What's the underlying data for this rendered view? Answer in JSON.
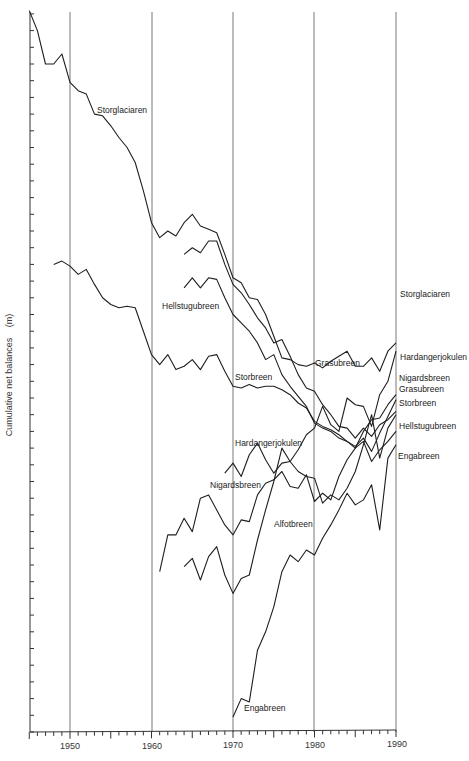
{
  "chart_data": {
    "type": "line",
    "title": "",
    "xlabel": "",
    "ylabel": "Cumulative net balances (m)",
    "xlim": [
      1945,
      1990
    ],
    "x_ticks": [
      1950,
      1960,
      1970,
      1980,
      1990
    ],
    "x_tick_labels": [
      "1950",
      "1960",
      "1970",
      "1980",
      "1990"
    ],
    "y_ticks_labeled": false,
    "y_units_note": "values in tick units above x-axis (no numeric y labels shown)",
    "grid": "vertical lines at decades",
    "legend": "inline labels",
    "series": [
      {
        "name": "Storglaciaren",
        "x": [
          1945,
          1946,
          1947,
          1948,
          1949,
          1950,
          1951,
          1952,
          1953,
          1954,
          1955,
          1956,
          1957,
          1958,
          1959,
          1960,
          1961,
          1962,
          1963,
          1964,
          1965,
          1966,
          1967,
          1968,
          1969,
          1970,
          1971,
          1972,
          1973,
          1974,
          1975,
          1976,
          1977,
          1978,
          1979,
          1980,
          1981,
          1982,
          1983,
          1984,
          1985,
          1986,
          1987,
          1988,
          1989,
          1990
        ],
        "values": [
          43.2,
          42.0,
          40.0,
          40.0,
          40.6,
          38.9,
          38.4,
          38.2,
          37.0,
          36.9,
          36.3,
          35.6,
          35.0,
          34.1,
          32.4,
          30.5,
          29.6,
          30.0,
          29.7,
          30.5,
          31.0,
          30.3,
          30.1,
          29.9,
          28.6,
          27.2,
          26.9,
          26.0,
          25.9,
          25.0,
          23.7,
          22.4,
          22.3,
          22.0,
          21.9,
          22.1,
          21.8,
          22.2,
          22.5,
          22.8,
          21.9,
          21.9,
          22.4,
          21.6,
          22.8,
          23.3
        ]
      },
      {
        "name": "Grasubreen",
        "x": [
          1964,
          1965,
          1966,
          1967,
          1968,
          1969,
          1970,
          1971,
          1972,
          1973,
          1974,
          1975,
          1976,
          1977,
          1978,
          1979,
          1980,
          1981,
          1982,
          1983,
          1984,
          1985,
          1986,
          1987,
          1988,
          1989,
          1990
        ],
        "values": [
          28.6,
          29.0,
          28.7,
          29.4,
          29.4,
          28.0,
          26.8,
          26.3,
          25.6,
          24.8,
          24.2,
          23.3,
          23.5,
          22.5,
          21.4,
          20.6,
          20.4,
          19.6,
          19.0,
          18.3,
          18.2,
          17.6,
          18.2,
          17.7,
          18.4,
          18.7,
          19.2
        ]
      },
      {
        "name": "Hellstugubreen",
        "x": [
          1964,
          1965,
          1966,
          1967,
          1968,
          1969,
          1970,
          1971,
          1972,
          1973,
          1974,
          1975,
          1976,
          1977,
          1978,
          1979,
          1980,
          1981,
          1982,
          1983,
          1984,
          1985,
          1986,
          1987,
          1988,
          1989,
          1990
        ],
        "values": [
          26.6,
          27.2,
          26.6,
          27.2,
          27.1,
          26.0,
          25.0,
          24.5,
          24.0,
          23.3,
          22.3,
          22.6,
          21.4,
          20.7,
          20.1,
          19.5,
          18.5,
          18.2,
          18.0,
          17.6,
          17.4,
          17.0,
          17.4,
          16.2,
          16.9,
          17.4,
          18.0
        ]
      },
      {
        "name": "Storbreen",
        "x": [
          1948,
          1949,
          1950,
          1951,
          1952,
          1953,
          1954,
          1955,
          1956,
          1957,
          1958,
          1959,
          1960,
          1961,
          1962,
          1963,
          1964,
          1965,
          1966,
          1967,
          1968,
          1969,
          1970,
          1971,
          1972,
          1973,
          1974,
          1975,
          1976,
          1977,
          1978,
          1979,
          1980,
          1981,
          1982,
          1983,
          1984,
          1985,
          1986,
          1987,
          1988,
          1989,
          1990
        ],
        "values": [
          28.0,
          28.2,
          27.9,
          27.4,
          27.7,
          26.8,
          26.0,
          25.6,
          25.4,
          25.5,
          25.4,
          24.0,
          22.6,
          22.0,
          22.6,
          21.7,
          21.9,
          22.3,
          21.7,
          22.5,
          22.6,
          21.6,
          20.7,
          20.6,
          20.8,
          20.6,
          20.7,
          20.7,
          20.5,
          20.2,
          19.7,
          19.4,
          18.6,
          18.3,
          18.1,
          17.8,
          17.4,
          17.1,
          17.6,
          16.8,
          17.9,
          18.9,
          19.9
        ]
      },
      {
        "name": "Hardangerjokulen",
        "x": [
          1969,
          1970,
          1971,
          1972,
          1973,
          1974,
          1975,
          1976,
          1977,
          1978,
          1979,
          1980,
          1981,
          1982,
          1983,
          1984,
          1985,
          1986,
          1987,
          1988,
          1989,
          1990
        ],
        "values": [
          15.5,
          16.1,
          15.3,
          16.6,
          17.3,
          16.3,
          15.5,
          16.1,
          16.2,
          16.9,
          17.8,
          18.2,
          19.5,
          18.4,
          18.0,
          20.0,
          19.6,
          19.5,
          18.3,
          20.2,
          21.0,
          22.8
        ]
      },
      {
        "name": "Nigardsbreen",
        "x": [
          1961,
          1962,
          1963,
          1964,
          1965,
          1966,
          1967,
          1968,
          1969,
          1970,
          1971,
          1972,
          1973,
          1974,
          1975,
          1976,
          1977,
          1978,
          1979,
          1980,
          1981,
          1982,
          1983,
          1984,
          1985,
          1986,
          1987,
          1988,
          1989,
          1990
        ],
        "values": [
          9.6,
          11.8,
          11.8,
          12.8,
          12.0,
          14.0,
          14.2,
          13.3,
          12.4,
          11.8,
          12.7,
          12.6,
          14.2,
          14.9,
          15.1,
          15.6,
          14.7,
          14.6,
          15.4,
          13.8,
          14.3,
          13.9,
          15.3,
          16.3,
          17.0,
          18.0,
          18.7,
          18.8,
          19.6,
          20.2
        ]
      },
      {
        "name": "Alfotbreen",
        "x": [
          1964,
          1965,
          1966,
          1967,
          1968,
          1969,
          1970,
          1971,
          1972,
          1973,
          1974,
          1975,
          1976,
          1977,
          1978,
          1979,
          1980,
          1981,
          1982,
          1983,
          1984,
          1985,
          1986,
          1987,
          1988,
          1989,
          1990
        ],
        "values": [
          9.9,
          10.4,
          9.1,
          10.5,
          11.1,
          9.4,
          8.3,
          9.2,
          9.4,
          11.5,
          13.3,
          15.0,
          17.0,
          16.2,
          15.6,
          15.3,
          15.2,
          13.7,
          14.2,
          13.9,
          14.6,
          15.6,
          17.2,
          19.0,
          16.4,
          18.2,
          19.0
        ]
      },
      {
        "name": "Engabreen",
        "x": [
          1970,
          1971,
          1972,
          1973,
          1974,
          1975,
          1976,
          1977,
          1978,
          1979,
          1980,
          1981,
          1982,
          1983,
          1984,
          1985,
          1986,
          1987,
          1988,
          1989,
          1990
        ],
        "values": [
          0.9,
          2.0,
          1.8,
          4.9,
          6.0,
          7.5,
          9.6,
          10.6,
          10.2,
          10.9,
          10.6,
          11.6,
          12.4,
          13.3,
          14.3,
          13.6,
          13.9,
          14.8,
          12.1,
          16.4,
          17.2
        ]
      }
    ]
  },
  "axis": {
    "ylabel": "Cumulative net balances",
    "yunit": "(m)",
    "x_tick_labels": [
      "1950",
      "1960",
      "1970",
      "1980",
      "1990"
    ]
  },
  "inline_labels": {
    "storglaciaren": "Storglaciaren",
    "hellstugubreen": "Hellstugubreen",
    "storbreen": "Storbreen",
    "grasubreen": "Grasubreen",
    "hardangerjokulen": "Hardangerjokulen",
    "nigardsbreen": "Nigardsbreen",
    "alfotbreen": "Alfotbreen",
    "engabreen": "Engabreen"
  },
  "right_labels": {
    "storglaciaren": "Storglaciaren",
    "hardangerjokulen": "Hardangerjokulen",
    "nigardsbreen": "Nigardsbreen",
    "grasubreen": "Grasubreen",
    "storbreen": "Storbreen",
    "hellstugubreen": "Hellstugubreen",
    "engabreen": "Engabreen"
  }
}
